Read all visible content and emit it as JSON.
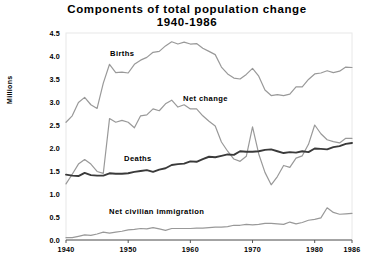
{
  "chart_data": {
    "type": "line",
    "title": "Components of total population change\n1940-1986",
    "xlabel": "",
    "ylabel": "Millions",
    "xlim": [
      1940,
      1986
    ],
    "ylim": [
      0.0,
      4.5
    ],
    "grid": false,
    "legend_position": "inline-annotations",
    "yticks": [
      "4.5",
      "4.0",
      "3.5",
      "3.0",
      "2.5",
      "2.0",
      "1.5",
      "1.0",
      "0.5",
      "0.0"
    ],
    "ytick_values": [
      4.5,
      4.0,
      3.5,
      3.0,
      2.5,
      2.0,
      1.5,
      1.0,
      0.5,
      0.0
    ],
    "xticks": [
      "1940",
      "1950",
      "1960",
      "1970",
      "1980",
      "1986"
    ],
    "xtick_values": [
      1940,
      1950,
      1960,
      1970,
      1980,
      1986
    ],
    "x": [
      1940,
      1941,
      1942,
      1943,
      1944,
      1945,
      1946,
      1947,
      1948,
      1949,
      1950,
      1951,
      1952,
      1953,
      1954,
      1955,
      1956,
      1957,
      1958,
      1959,
      1960,
      1961,
      1962,
      1963,
      1964,
      1965,
      1966,
      1967,
      1968,
      1969,
      1970,
      1971,
      1972,
      1973,
      1974,
      1975,
      1976,
      1977,
      1978,
      1979,
      1980,
      1981,
      1982,
      1983,
      1984,
      1985,
      1986
    ],
    "series": [
      {
        "name": "Births",
        "color": "#999999",
        "values": [
          2.56,
          2.7,
          2.99,
          3.1,
          2.94,
          2.86,
          3.41,
          3.82,
          3.64,
          3.65,
          3.63,
          3.82,
          3.91,
          3.97,
          4.08,
          4.1,
          4.22,
          4.31,
          4.26,
          4.3,
          4.26,
          4.27,
          4.17,
          4.1,
          4.03,
          3.76,
          3.61,
          3.52,
          3.5,
          3.6,
          3.73,
          3.56,
          3.26,
          3.14,
          3.16,
          3.14,
          3.17,
          3.33,
          3.33,
          3.49,
          3.61,
          3.63,
          3.68,
          3.64,
          3.67,
          3.76,
          3.75
        ]
      },
      {
        "name": "Net change",
        "color": "#999999",
        "values": [
          1.22,
          1.43,
          1.65,
          1.75,
          1.65,
          1.49,
          1.45,
          2.64,
          2.56,
          2.6,
          2.56,
          2.44,
          2.7,
          2.72,
          2.85,
          2.81,
          2.96,
          3.04,
          2.89,
          2.94,
          2.85,
          2.85,
          2.7,
          2.58,
          2.48,
          2.13,
          1.93,
          1.76,
          1.71,
          1.82,
          2.46,
          1.87,
          1.47,
          1.2,
          1.38,
          1.62,
          1.58,
          1.78,
          1.83,
          2.08,
          2.5,
          2.31,
          2.18,
          2.14,
          2.11,
          2.21,
          2.21
        ]
      },
      {
        "name": "Deaths",
        "color": "#3a3a3a",
        "values": [
          1.42,
          1.4,
          1.39,
          1.46,
          1.41,
          1.4,
          1.4,
          1.45,
          1.44,
          1.44,
          1.45,
          1.48,
          1.5,
          1.52,
          1.48,
          1.53,
          1.56,
          1.63,
          1.65,
          1.66,
          1.71,
          1.7,
          1.76,
          1.81,
          1.8,
          1.83,
          1.86,
          1.85,
          1.93,
          1.92,
          1.92,
          1.93,
          1.96,
          1.97,
          1.93,
          1.89,
          1.91,
          1.9,
          1.93,
          1.91,
          1.99,
          1.98,
          1.97,
          2.02,
          2.04,
          2.09,
          2.11
        ]
      },
      {
        "name": "Net civilian immigration",
        "color": "#999999",
        "values": [
          0.05,
          0.05,
          0.08,
          0.11,
          0.1,
          0.13,
          0.17,
          0.15,
          0.17,
          0.19,
          0.22,
          0.23,
          0.25,
          0.24,
          0.27,
          0.24,
          0.21,
          0.25,
          0.25,
          0.25,
          0.25,
          0.26,
          0.26,
          0.27,
          0.28,
          0.28,
          0.29,
          0.32,
          0.32,
          0.34,
          0.33,
          0.34,
          0.36,
          0.36,
          0.35,
          0.34,
          0.39,
          0.35,
          0.38,
          0.43,
          0.45,
          0.48,
          0.7,
          0.6,
          0.56,
          0.57,
          0.58
        ]
      }
    ],
    "annotations": [
      {
        "text": "Births",
        "x_px": 110,
        "y_px": 49
      },
      {
        "text": "Net change",
        "x_px": 183,
        "y_px": 94
      },
      {
        "text": "Deaths",
        "x_px": 124,
        "y_px": 154
      },
      {
        "text": "Net civilian immigration",
        "x_px": 109,
        "y_px": 207
      }
    ]
  },
  "axes": {
    "y_axis_title": "Millions"
  }
}
